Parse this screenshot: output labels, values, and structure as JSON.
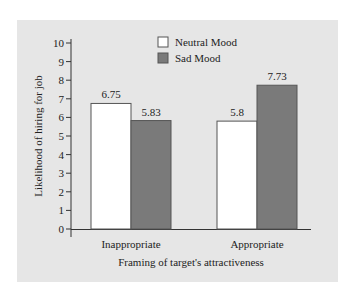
{
  "chart_data": {
    "type": "bar",
    "title": "",
    "xlabel": "Framing of target's attractiveness",
    "ylabel": "Likelihood of hiring for job",
    "ylim": [
      0,
      10
    ],
    "yticks": [
      0,
      1,
      2,
      3,
      4,
      5,
      6,
      7,
      8,
      9,
      10
    ],
    "categories": [
      "Inappropriate",
      "Appropriate"
    ],
    "series": [
      {
        "name": "Neutral Mood",
        "color": "#ffffff",
        "values": [
          6.75,
          5.8
        ]
      },
      {
        "name": "Sad Mood",
        "color": "#7a7a7a",
        "values": [
          5.83,
          7.73
        ]
      }
    ],
    "value_labels": [
      [
        "6.75",
        "5.8"
      ],
      [
        "5.83",
        "7.73"
      ]
    ],
    "legend_position": "top-right",
    "grid": false,
    "background": "#e6e6e6"
  }
}
